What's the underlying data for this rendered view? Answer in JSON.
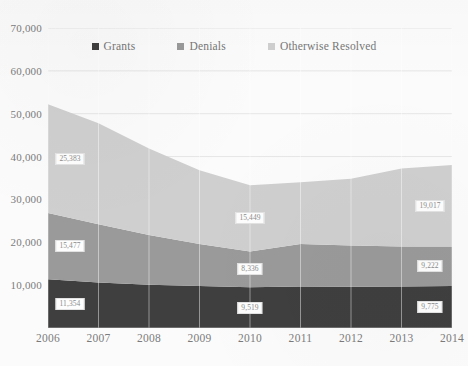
{
  "chart_data": {
    "type": "area",
    "stacked": true,
    "title": "",
    "xlabel": "",
    "ylabel": "",
    "categories": [
      "2006",
      "2007",
      "2008",
      "2009",
      "2010",
      "2011",
      "2012",
      "2013",
      "2014"
    ],
    "ylim": [
      0,
      70000
    ],
    "yticks": [
      10000,
      20000,
      30000,
      40000,
      50000,
      60000,
      70000
    ],
    "ytick_labels": [
      "10,000",
      "20,000",
      "30,000",
      "40,000",
      "50,000",
      "60,000",
      "70,000"
    ],
    "grid": true,
    "grid_axis": "y",
    "legend_position": "top-center",
    "series": [
      {
        "name": "Grants",
        "color": "#3f3f3f",
        "values": [
          11354,
          10600,
          10100,
          9800,
          9519,
          9700,
          9650,
          9700,
          9775
        ],
        "labels": [
          {
            "category": "2006",
            "value": 11354,
            "text": "11,354"
          },
          {
            "category": "2010",
            "value": 9519,
            "text": "9,519"
          },
          {
            "category": "2014",
            "value": 9775,
            "text": "9,775"
          }
        ]
      },
      {
        "name": "Denials",
        "color": "#9a9a9a",
        "values": [
          15477,
          13600,
          11600,
          9800,
          8336,
          9900,
          9600,
          9300,
          9222
        ],
        "labels": [
          {
            "category": "2006",
            "value": 15477,
            "text": "15,477"
          },
          {
            "category": "2010",
            "value": 8336,
            "text": "8,336"
          },
          {
            "category": "2014",
            "value": 9222,
            "text": "9,222"
          }
        ]
      },
      {
        "name": "Otherwise Resolved",
        "color": "#cfcfcf",
        "values": [
          25383,
          23600,
          20200,
          17200,
          15449,
          14400,
          15600,
          18200,
          19017
        ],
        "labels": [
          {
            "category": "2006",
            "value": 25383,
            "text": "25,383"
          },
          {
            "category": "2010",
            "value": 15449,
            "text": "15,449"
          },
          {
            "category": "2014",
            "value": 19017,
            "text": "19,017"
          }
        ]
      }
    ],
    "totals": [
      52214,
      47800,
      41900,
      36800,
      33304,
      34000,
      34850,
      37200,
      38014
    ]
  },
  "legend": {
    "items": [
      {
        "label": "Grants",
        "color": "#3f3f3f"
      },
      {
        "label": "Denials",
        "color": "#9a9a9a"
      },
      {
        "label": "Otherwise Resolved",
        "color": "#cfcfcf"
      }
    ]
  }
}
